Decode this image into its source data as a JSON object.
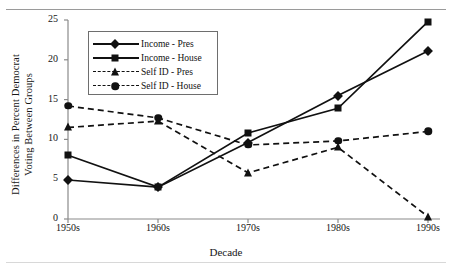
{
  "chart_data": {
    "type": "line",
    "title": "",
    "xlabel": "Decade",
    "ylabel": "Differences in Percent Democrat Voting Between Groups",
    "ylabel_line1": "Differences in Percent Democrat",
    "ylabel_line2": "Voting Between Groups",
    "categories": [
      "1950s",
      "1960s",
      "1970s",
      "1980s",
      "1990s"
    ],
    "ylim": [
      0,
      25
    ],
    "yticks": [
      0,
      5,
      10,
      15,
      20,
      25
    ],
    "grid": false,
    "legend_position": "upper-left-inside",
    "series": [
      {
        "name": "Income - Pres",
        "marker": "diamond",
        "linestyle": "solid",
        "color": "#111111",
        "values": [
          4.9,
          4.0,
          9.6,
          15.5,
          21.1
        ]
      },
      {
        "name": "Income - House",
        "marker": "square",
        "linestyle": "solid",
        "color": "#111111",
        "values": [
          8.0,
          4.0,
          10.8,
          13.9,
          24.8
        ]
      },
      {
        "name": "Self ID - Pres",
        "marker": "triangle",
        "linestyle": "dashed",
        "color": "#111111",
        "values": [
          11.5,
          12.3,
          5.8,
          9.0,
          0.3
        ]
      },
      {
        "name": "Self ID - House",
        "marker": "circle",
        "linestyle": "dashed",
        "color": "#111111",
        "values": [
          14.2,
          12.7,
          9.3,
          9.8,
          11.0
        ]
      }
    ]
  }
}
